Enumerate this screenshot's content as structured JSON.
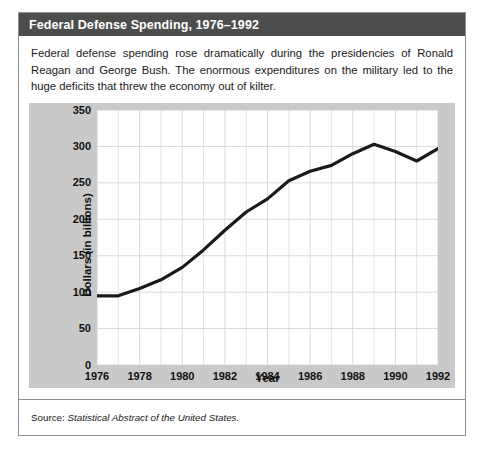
{
  "figure": {
    "title": "Federal Defense Spending, 1976–1992",
    "description": "Federal defense spending rose dramatically during the presidencies of Ronald Reagan and George Bush. The enormous expenditures on the military led to the huge deficits that threw the economy out of kilter.",
    "source_prefix": "Source: ",
    "source_work": "Statistical Abstract of the United States."
  },
  "colors": {
    "title_bar": "#4d4d4d",
    "title_text": "#ffffff",
    "chart_panel": "#c9c9c9",
    "plot_background": "#ffffff",
    "gridline": "#d9d9d9",
    "line": "#1a1a1a",
    "border": "#8f8f8f"
  },
  "chart_data": {
    "type": "line",
    "title": "Federal Defense Spending, 1976–1992",
    "xlabel": "Year",
    "ylabel": "Dollars (in billions)",
    "xlim": [
      1976,
      1992
    ],
    "ylim": [
      0,
      350
    ],
    "yticks": [
      0,
      50,
      100,
      150,
      200,
      250,
      300,
      350
    ],
    "xticks": [
      1976,
      1978,
      1980,
      1982,
      1984,
      1986,
      1988,
      1990,
      1992
    ],
    "grid": true,
    "legend": "none",
    "x": [
      1976,
      1977,
      1978,
      1979,
      1980,
      1981,
      1982,
      1983,
      1984,
      1985,
      1986,
      1987,
      1988,
      1989,
      1990,
      1991,
      1992
    ],
    "series": [
      {
        "name": "Federal defense spending",
        "values": [
          95,
          95,
          105,
          117,
          134,
          158,
          185,
          210,
          228,
          253,
          266,
          274,
          290,
          303,
          293,
          280,
          297
        ]
      }
    ]
  }
}
